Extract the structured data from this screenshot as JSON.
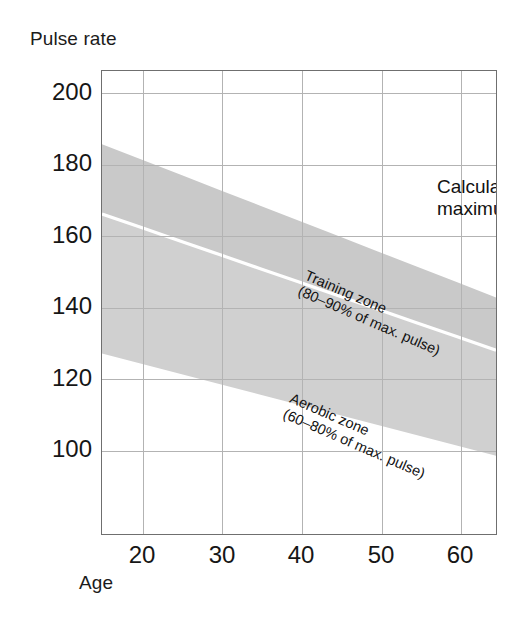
{
  "figure": {
    "ylabel": "Pulse rate",
    "xlabel": "Age"
  },
  "annotations": {
    "max_pulse_line1": "Calculated",
    "max_pulse_line2": "maximum pulse",
    "training_line1": "Training zone",
    "training_line2": "(80–90% of max. pulse)",
    "aerobic_line1": "Aerobic zone",
    "aerobic_line2": "(60–80% of max. pulse)"
  },
  "colors": {
    "band_fill": "#d0d0d0",
    "band_fill_upper": "#c9c9c9",
    "grid": "#b3b3b3",
    "frame": "#6f6f6f",
    "text": "#161616",
    "background": "#ffffff",
    "separator": "#ffffff"
  },
  "chart_data": {
    "type": "area",
    "title": "",
    "subtitle": "",
    "xlabel": "Age",
    "ylabel": "Pulse rate",
    "xlim": [
      15,
      65
    ],
    "ylim": [
      70,
      206
    ],
    "xticks": [
      20,
      30,
      40,
      50,
      60
    ],
    "yticks": [
      100,
      120,
      140,
      160,
      180,
      200
    ],
    "xticklabels": [
      "20",
      "30",
      "40",
      "50",
      "60"
    ],
    "yticklabels": [
      "100",
      "120",
      "140",
      "160",
      "180",
      "200"
    ],
    "grid": true,
    "legend": "none",
    "x": [
      15,
      20,
      25,
      30,
      35,
      40,
      45,
      50,
      55,
      60,
      65
    ],
    "series": [
      {
        "name": "Calculated maximum pulse",
        "formula": "220 - age",
        "values": [
          205,
          200,
          195,
          190,
          185,
          180,
          175,
          170,
          165,
          160,
          155
        ]
      },
      {
        "name": "Training zone upper bound (90% of max. pulse)",
        "formula": "0.90 * (220 - age)",
        "values": [
          184.5,
          180,
          175.5,
          171,
          166.5,
          162,
          157.5,
          153,
          148.5,
          144,
          139.5
        ]
      },
      {
        "name": "Training zone lower bound / Aerobic zone upper bound (80% of max. pulse)",
        "formula": "0.80 * (220 - age)",
        "values": [
          164,
          160,
          156,
          152,
          148,
          144,
          140,
          136,
          132,
          128,
          124
        ]
      },
      {
        "name": "Aerobic zone lower bound (60% of max. pulse)",
        "formula": "0.60 * (220 - age)",
        "values": [
          123,
          120,
          117,
          114,
          111,
          108,
          105,
          102,
          99,
          96,
          93
        ]
      }
    ],
    "bands": [
      {
        "name": "Training zone",
        "label": "Training zone (80–90% of max. pulse)",
        "lower_pct": 80,
        "upper_pct": 90,
        "fill": "#c9c9c9"
      },
      {
        "name": "Aerobic zone",
        "label": "Aerobic zone (60–80% of max. pulse)",
        "lower_pct": 60,
        "upper_pct": 80,
        "fill": "#d0d0d0"
      }
    ]
  }
}
